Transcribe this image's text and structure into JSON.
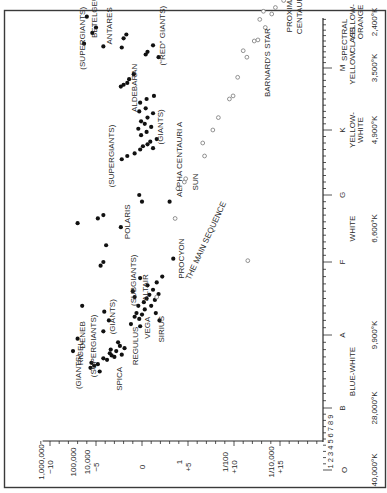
{
  "chart_data": {
    "type": "scatter",
    "orientation": "rotated 90 degrees counter-clockwise (spectral class runs bottom-to-top, magnitude runs left-to-right)",
    "xlabel": "Spectral Class",
    "ylabel": "Absolute Magnitude / Luminosity (Sun = 1)",
    "magnitude_axis": {
      "ticks": [
        {
          "mag": -10,
          "label": "−10",
          "luminosity": "1,000,000"
        },
        {
          "mag": -5,
          "label": "−5",
          "luminosity": "10,000"
        },
        {
          "mag": 0,
          "label": "0",
          "luminosity": ""
        },
        {
          "mag": 5,
          "label": "+5",
          "luminosity": "1"
        },
        {
          "mag": 10,
          "label": "+10",
          "luminosity": "1/100"
        },
        {
          "mag": 15,
          "label": "+15",
          "luminosity": "1/10,000"
        }
      ],
      "extra_luminosity_labels": [
        {
          "mag": -7.5,
          "label": "100,000"
        }
      ],
      "range": [
        -12,
        19.5
      ]
    },
    "spectral_axis": {
      "title_line1": "SPECTRAL",
      "title_line2": "CLASS",
      "subdivision_labels": "1 2 3 4 5 6 7 8 9",
      "classes": [
        {
          "cls": "O",
          "color": "",
          "temp": "40,000°K"
        },
        {
          "cls": "B",
          "color": "BLUE-WHITE",
          "temp": "28,000°K"
        },
        {
          "cls": "A",
          "color": "",
          "temp": "9,900°K"
        },
        {
          "cls": "F",
          "color": "WHITE",
          "temp": "6,600°K"
        },
        {
          "cls": "G",
          "color": "",
          "temp": ""
        },
        {
          "cls": "K",
          "color": "YELLOW-WHITE",
          "temp": "4,900°K"
        },
        {
          "cls": "M",
          "color": "YELLOW",
          "temp": "3,500°K"
        },
        {
          "cls": "",
          "color": "YELLOW-ORANGE",
          "temp": "2,400°K"
        }
      ]
    },
    "series": [
      {
        "name": "Giants, supergiants and bright stars (filled)",
        "marker": "filled",
        "points": [
          [
            1.55,
            -5.6
          ],
          [
            1.58,
            -5.2
          ],
          [
            1.6,
            -4.8
          ],
          [
            1.62,
            -5.5
          ],
          [
            1.5,
            -4.6
          ],
          [
            1.68,
            -4.2
          ],
          [
            1.72,
            -3.3
          ],
          [
            1.75,
            -3.5
          ],
          [
            1.7,
            -3.0
          ],
          [
            1.78,
            -2.8
          ],
          [
            1.66,
            -3.8
          ],
          [
            1.8,
            -3.4
          ],
          [
            1.85,
            -2.4
          ],
          [
            1.82,
            -1.9
          ],
          [
            1.9,
            -2.6
          ],
          [
            1.73,
            -2.2
          ],
          [
            1.78,
            -7.5
          ],
          [
            1.95,
            -7.0
          ],
          [
            2.4,
            -6.5
          ],
          [
            2.05,
            -4.2
          ],
          [
            2.2,
            -3.6
          ],
          [
            2.32,
            -4.1
          ],
          [
            2.15,
            -1.2
          ],
          [
            2.25,
            -0.8
          ],
          [
            2.22,
            -0.3
          ],
          [
            2.3,
            -0.6
          ],
          [
            2.28,
            0.0
          ],
          [
            2.35,
            0.3
          ],
          [
            2.12,
            -0.2
          ],
          [
            2.4,
            -0.4
          ],
          [
            2.45,
            0.2
          ],
          [
            2.5,
            0.5
          ],
          [
            2.55,
            0.8
          ],
          [
            2.62,
            1.2
          ],
          [
            2.4,
            1.0
          ],
          [
            2.48,
            1.4
          ],
          [
            2.56,
            1.8
          ],
          [
            2.3,
            1.5
          ],
          [
            2.2,
            1.9
          ],
          [
            2.52,
            -0.8
          ],
          [
            2.6,
            -1.0
          ],
          [
            2.68,
            0.6
          ],
          [
            2.72,
            1.6
          ],
          [
            2.8,
            2.2
          ],
          [
            2.78,
            -0.2
          ],
          [
            2.95,
            -4.5
          ],
          [
            3.0,
            -4.2
          ],
          [
            3.25,
            -3.9
          ],
          [
            3.58,
            -7.0
          ],
          [
            3.65,
            -4.8
          ],
          [
            3.52,
            -2.3
          ],
          [
            3.7,
            -4.2
          ],
          [
            3.9,
            0.0
          ],
          [
            4.0,
            -0.3
          ],
          [
            3.05,
            3.4
          ],
          [
            3.9,
            3.0
          ],
          [
            4.55,
            -2.2
          ],
          [
            4.6,
            -1.6
          ],
          [
            4.64,
            -0.8
          ],
          [
            4.7,
            -0.2
          ],
          [
            4.75,
            0.1
          ],
          [
            4.78,
            0.6
          ],
          [
            4.82,
            0.9
          ],
          [
            4.72,
            1.2
          ],
          [
            4.86,
            1.6
          ],
          [
            4.92,
            -0.1
          ],
          [
            4.97,
            0.5
          ],
          [
            5.02,
            -0.4
          ],
          [
            5.05,
            1.0
          ],
          [
            5.1,
            0.3
          ],
          [
            5.14,
            -0.1
          ],
          [
            5.2,
            0.6
          ],
          [
            5.27,
            1.2
          ],
          [
            5.3,
            -0.3
          ],
          [
            5.35,
            0.4
          ],
          [
            5.44,
            -0.2
          ],
          [
            5.5,
            0.5
          ],
          [
            5.55,
            1.3
          ],
          [
            5.7,
            -2.3
          ],
          [
            5.73,
            -2.0
          ],
          [
            5.76,
            -1.6
          ],
          [
            5.82,
            -1.4
          ],
          [
            5.9,
            -0.9
          ],
          [
            6.65,
            -5.4
          ],
          [
            6.4,
            -4.2
          ],
          [
            6.38,
            -2.2
          ],
          [
            6.55,
            -2.0
          ],
          [
            6.62,
            -1.7
          ],
          [
            6.25,
            0.4
          ],
          [
            6.3,
            0.6
          ],
          [
            6.42,
            1.2
          ],
          [
            6.2,
            1.8
          ],
          [
            6.95,
            -6.0
          ],
          [
            6.75,
            -5.0
          ],
          [
            6.45,
            -6.3
          ]
        ]
      },
      {
        "name": "Main sequence dwarfs (open)",
        "marker": "open",
        "points": [
          [
            2.52,
            1.6
          ],
          [
            3.65,
            3.6
          ],
          [
            3.02,
            11.5
          ],
          [
            4.2,
            4.6
          ],
          [
            4.25,
            4.75
          ],
          [
            4.1,
            3.9
          ],
          [
            4.6,
            6.8
          ],
          [
            4.8,
            6.6
          ],
          [
            5.0,
            7.7
          ],
          [
            5.2,
            8.3
          ],
          [
            5.5,
            9.5
          ],
          [
            5.55,
            9.9
          ],
          [
            5.85,
            10.4
          ],
          [
            6.2,
            11.4
          ],
          [
            6.32,
            11.0
          ],
          [
            6.5,
            12.2
          ],
          [
            6.52,
            12.6
          ],
          [
            6.75,
            13.4
          ],
          [
            6.9,
            12.8
          ],
          [
            7.05,
            13.2
          ],
          [
            7.0,
            14.1
          ],
          [
            7.12,
            14.5
          ],
          [
            7.25,
            15.4
          ],
          [
            7.48,
            15.8
          ]
        ]
      }
    ],
    "annotations": [
      {
        "text": "BETELGEUSE",
        "spec": 7.05,
        "mag": -4.9
      },
      {
        "text": "ANTARES",
        "spec": 6.78,
        "mag": -3.3
      },
      {
        "text": "ALDEBARAN",
        "spec": 5.68,
        "mag": -0.5
      },
      {
        "text": "(“RED” GIANTS)",
        "spec": 6.6,
        "mag": 2.5
      },
      {
        "text": "(GIANTS)",
        "spec": 5.05,
        "mag": 2.3
      },
      {
        "text": "ALPHA CENTAURI  A",
        "spec": 4.55,
        "mag": 4.3
      },
      {
        "text": "SUN",
        "spec": 4.2,
        "mag": 6.1
      },
      {
        "text": "(SUPERGIANTS)",
        "spec": 6.55,
        "mag": -6.2
      },
      {
        "text": "(SUPERGIANTS)",
        "spec": 4.6,
        "mag": -3.0
      },
      {
        "text": "POLARIS",
        "spec": 3.6,
        "mag": -1.3
      },
      {
        "text": "PROCYON",
        "spec": 3.05,
        "mag": 4.6
      },
      {
        "text": "(SUBGIANTS)",
        "spec": 2.75,
        "mag": -0.6
      },
      {
        "text": "ALTAIR",
        "spec": 2.65,
        "mag": 0.7
      },
      {
        "text": "(GIANTS)",
        "spec": 2.25,
        "mag": -2.9
      },
      {
        "text": "DENEB",
        "spec": 2.0,
        "mag": -6.2
      },
      {
        "text": "RIGEL",
        "spec": 1.75,
        "mag": -6.4
      },
      {
        "text": "(SUPERGIANTS)",
        "spec": 1.85,
        "mag": -5.0
      },
      {
        "text": "(GIANTS)",
        "spec": 1.5,
        "mag": -6.6
      },
      {
        "text": "SPICA",
        "spec": 1.4,
        "mag": -2.2
      },
      {
        "text": "REGULUS",
        "spec": 1.85,
        "mag": -0.4
      },
      {
        "text": "VEGA",
        "spec": 2.1,
        "mag": 0.9
      },
      {
        "text": "SIRIUS",
        "spec": 2.08,
        "mag": 2.4
      },
      {
        "text": "THE MAIN SEQUENCE",
        "spec": 3.3,
        "mag": 7.2,
        "rotate": -65
      },
      {
        "text": "BARNARD'S STAR",
        "spec": 6.1,
        "mag": 13.9
      },
      {
        "text": "PROXIMA",
        "spec": 7.0,
        "mag": 16.3
      },
      {
        "text": "CENTAURI",
        "spec": 7.0,
        "mag": 17.4
      }
    ],
    "grid": false,
    "legend": "none"
  }
}
